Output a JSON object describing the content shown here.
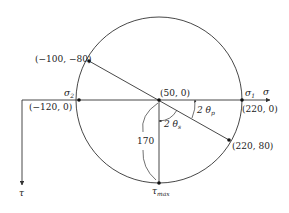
{
  "diagram": {
    "axes": {
      "sigma_label": "σ",
      "tau_label": "τ"
    },
    "points": {
      "center": "(50, 0)",
      "upper_left": "(−100, −80)",
      "lower_right": "(220, 80)",
      "sigma_1": "(220, 0)",
      "sigma_2": "(−120, 0)"
    },
    "labels": {
      "sigma1_main": "σ",
      "sigma1_sub": "1",
      "sigma2_main": "σ",
      "sigma2_sub": "2",
      "tau_max_main": "τ",
      "tau_max_sub": "max",
      "radius_value": "170",
      "angle_p_main": "2 θ",
      "angle_p_sub": "p",
      "angle_s_main": "2 θ",
      "angle_s_sub": "s"
    },
    "colors": {
      "line": "#333333",
      "text": "#222222"
    }
  }
}
